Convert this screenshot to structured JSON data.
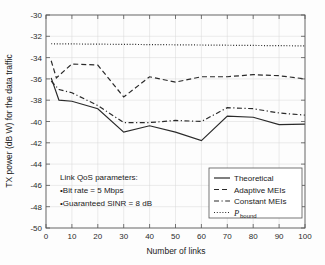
{
  "chart_data": {
    "type": "line",
    "title": "",
    "xlabel": "Number of links",
    "ylabel": "TX power (dB W) for the data traffic",
    "xlim": [
      0,
      100
    ],
    "ylim": [
      -50,
      -30
    ],
    "xticks": [
      0,
      10,
      20,
      30,
      40,
      50,
      60,
      70,
      80,
      90,
      100
    ],
    "yticks": [
      -30,
      -32,
      -34,
      -36,
      -38,
      -40,
      -42,
      -44,
      -46,
      -48,
      -50
    ],
    "xtick_labels": [
      "0",
      "10",
      "20",
      "30",
      "40",
      "50",
      "60",
      "70",
      "80",
      "90",
      "100"
    ],
    "ytick_labels": [
      "-30",
      "-32",
      "-34",
      "-36",
      "-38",
      "-40",
      "-42",
      "-44",
      "-46",
      "-48",
      "-50"
    ],
    "grid": true,
    "legend_position": "lower-right",
    "series": [
      {
        "name": "Theoretical",
        "style": "solid",
        "x": [
          2,
          5,
          10,
          20,
          30,
          40,
          50,
          60,
          70,
          80,
          90,
          100
        ],
        "values": [
          -35.9,
          -38.0,
          -38.1,
          -38.8,
          -41.0,
          -40.4,
          -41.0,
          -41.8,
          -39.5,
          -39.6,
          -40.3,
          -40.25
        ]
      },
      {
        "name": "Adaptive MEIs",
        "style": "dashed",
        "x": [
          2,
          4,
          10,
          20,
          30,
          40,
          50,
          60,
          70,
          80,
          90,
          100
        ],
        "values": [
          -34.3,
          -35.9,
          -34.6,
          -34.7,
          -37.7,
          -35.8,
          -36.3,
          -35.8,
          -35.8,
          -35.6,
          -35.7,
          -36.0
        ]
      },
      {
        "name": "Constant MEIs",
        "style": "dashdot",
        "x": [
          2,
          5,
          10,
          20,
          30,
          40,
          50,
          60,
          70,
          80,
          90,
          100
        ],
        "values": [
          -36.2,
          -37.0,
          -37.3,
          -38.5,
          -40.1,
          -40.1,
          -39.9,
          -40.0,
          -38.7,
          -38.8,
          -39.2,
          -39.4
        ]
      },
      {
        "name": "P_bound",
        "style": "dotted",
        "x": [
          2,
          100
        ],
        "values": [
          -32.7,
          -32.9
        ]
      }
    ],
    "annotations": [
      "Link QoS parameters:",
      "•Bit rate = 5 Mbps",
      "•Guaranteed SINR = 8 dB"
    ]
  },
  "legend": {
    "entries": [
      {
        "label": "Theoretical",
        "sub": ""
      },
      {
        "label": "Adaptive MEIs",
        "sub": ""
      },
      {
        "label": "Constant MEIs",
        "sub": ""
      },
      {
        "label": "P",
        "sub": "bound"
      }
    ]
  },
  "annotation": {
    "line1": "Link QoS parameters:",
    "line2": "•Bit rate = 5 Mbps",
    "line3": "•Guaranteed SINR = 8 dB"
  },
  "axes": {
    "x_title": "Number of links",
    "y_title": "TX power (dB W) for the data traffic"
  }
}
